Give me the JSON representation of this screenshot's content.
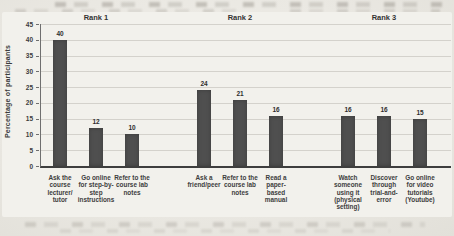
{
  "chart_data": {
    "type": "bar",
    "title": "",
    "ylabel": "Percentage of participants",
    "xlabel": "",
    "ylim": [
      0,
      45
    ],
    "ytick_step": 5,
    "grid": true,
    "legend": null,
    "bar_color": "#4f4f4f",
    "groups": [
      {
        "label": "Rank 1",
        "bars": [
          {
            "category": "Ask the\ncourse\nlecturer/\ntutor",
            "value": 40
          },
          {
            "category": "Go online\nfor step-by-\nstep\ninstructions",
            "value": 12
          },
          {
            "category": "Refer to the\ncourse lab\nnotes",
            "value": 10
          }
        ]
      },
      {
        "label": "Rank 2",
        "bars": [
          {
            "category": "Ask a\nfriend/peer",
            "value": 24
          },
          {
            "category": "Refer to the\ncourse lab\nnotes",
            "value": 21
          },
          {
            "category": "Read a\npaper-\nbased\nmanual",
            "value": 16
          }
        ]
      },
      {
        "label": "Rank 3",
        "bars": [
          {
            "category": "Watch\nsomeone\nusing it\n(physical\nsetting)",
            "value": 16
          },
          {
            "category": "Discover\nthrough\ntrial-and-\nerror",
            "value": 16
          },
          {
            "category": "Go online\nfor video\ntutorials\n(Youtube)",
            "value": 15
          }
        ]
      }
    ]
  }
}
